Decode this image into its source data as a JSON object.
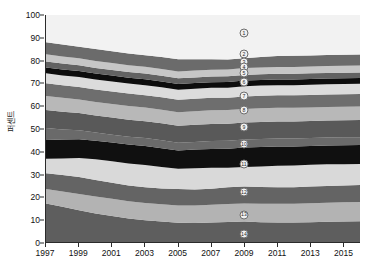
{
  "chart_data": {
    "type": "area",
    "stacked": true,
    "title": "",
    "subtitle": "",
    "xlabel": "",
    "ylabel": "퍼센트",
    "xlim": [
      1997,
      2016
    ],
    "ylim": [
      0,
      100
    ],
    "grid": false,
    "legend_position": "none",
    "x": [
      1997,
      1998,
      1999,
      2000,
      2001,
      2002,
      2003,
      2004,
      2005,
      2006,
      2007,
      2008,
      2009,
      2010,
      2011,
      2012,
      2013,
      2014,
      2015,
      2016
    ],
    "xticks": [
      "1997",
      "1999",
      "2001",
      "2003",
      "2005",
      "2007",
      "2009",
      "2011",
      "2013",
      "2015"
    ],
    "xtick_values": [
      1997,
      1999,
      2001,
      2003,
      2005,
      2007,
      2009,
      2011,
      2013,
      2015
    ],
    "yticks": [
      "0",
      "10",
      "20",
      "30",
      "40",
      "50",
      "60",
      "70",
      "80",
      "90",
      "100"
    ],
    "ytick_values": [
      0,
      10,
      20,
      30,
      40,
      50,
      60,
      70,
      80,
      90,
      100
    ],
    "annotations": [
      {
        "label": "1",
        "x": 2009,
        "y": 92.0
      },
      {
        "label": "2",
        "x": 2009,
        "y": 83.0
      },
      {
        "label": "3",
        "x": 2009,
        "y": 79.5
      },
      {
        "label": "4",
        "x": 2009,
        "y": 77.0
      },
      {
        "label": "5",
        "x": 2009,
        "y": 74.5
      },
      {
        "label": "6",
        "x": 2009,
        "y": 70.5
      },
      {
        "label": "7",
        "x": 2009,
        "y": 64.5
      },
      {
        "label": "8",
        "x": 2009,
        "y": 58.5
      },
      {
        "label": "9",
        "x": 2009,
        "y": 51.0
      },
      {
        "label": "10",
        "x": 2009,
        "y": 43.5
      },
      {
        "label": "11",
        "x": 2009,
        "y": 34.5
      },
      {
        "label": "12",
        "x": 2009,
        "y": 22.5
      },
      {
        "label": "13",
        "x": 2009,
        "y": 12.5
      },
      {
        "label": "14",
        "x": 2009,
        "y": 4.0
      }
    ],
    "series": [
      {
        "name": "14",
        "marker_label": "14",
        "color": "#5e5e5e",
        "values": [
          17.0,
          15.5,
          14.0,
          12.6,
          11.5,
          10.4,
          9.6,
          9.0,
          8.5,
          8.4,
          8.6,
          8.8,
          9.0,
          8.7,
          8.6,
          8.6,
          8.7,
          8.9,
          9.0,
          9.1
        ]
      },
      {
        "name": "13",
        "marker_label": "13",
        "color": "#b3b3b3",
        "values": [
          6.4,
          6.8,
          7.2,
          7.4,
          7.5,
          7.6,
          7.6,
          7.6,
          7.6,
          7.7,
          7.8,
          7.9,
          8.0,
          8.2,
          8.3,
          8.3,
          8.4,
          8.4,
          8.5,
          8.5
        ]
      },
      {
        "name": "12",
        "marker_label": "12",
        "color": "#646464",
        "values": [
          6.9,
          7.2,
          7.4,
          7.3,
          7.1,
          6.9,
          6.9,
          7.0,
          7.3,
          7.0,
          7.1,
          7.4,
          7.5,
          7.3,
          7.2,
          7.2,
          7.3,
          7.4,
          7.4,
          7.5
        ]
      },
      {
        "name": "11",
        "marker_label": "11",
        "color": "#d9d9d9",
        "values": [
          6.4,
          7.3,
          8.4,
          9.1,
          9.5,
          9.7,
          9.8,
          9.4,
          8.9,
          9.4,
          9.2,
          8.6,
          8.5,
          9.1,
          9.5,
          9.6,
          9.6,
          9.5,
          9.4,
          9.3
        ]
      },
      {
        "name": "10",
        "marker_label": "10",
        "color": "#101010",
        "values": [
          8.2,
          8.4,
          8.3,
          8.2,
          8.2,
          8.3,
          8.4,
          8.3,
          8.0,
          8.2,
          8.3,
          8.4,
          8.6,
          8.6,
          8.5,
          8.4,
          8.3,
          8.3,
          8.3,
          8.3
        ]
      },
      {
        "name": "9",
        "marker_label": "9",
        "color": "#6a6a6a",
        "values": [
          5.3,
          4.4,
          3.9,
          3.6,
          3.5,
          3.5,
          3.5,
          3.5,
          3.4,
          3.4,
          3.5,
          3.5,
          3.5,
          3.5,
          3.5,
          3.5,
          3.5,
          3.5,
          3.5,
          3.5
        ]
      },
      {
        "name": "8",
        "marker_label": "8",
        "color": "#595959",
        "values": [
          7.9,
          7.8,
          7.6,
          7.5,
          7.5,
          7.5,
          7.4,
          7.5,
          7.5,
          7.5,
          7.5,
          7.5,
          7.5,
          7.5,
          7.5,
          7.5,
          7.5,
          7.5,
          7.5,
          7.5
        ]
      },
      {
        "name": "7",
        "marker_label": "7",
        "color": "#b8b8b8",
        "values": [
          6.2,
          6.1,
          6.0,
          6.0,
          6.0,
          6.0,
          6.0,
          6.0,
          6.0,
          6.0,
          6.0,
          6.0,
          6.0,
          6.0,
          6.0,
          6.0,
          6.0,
          6.0,
          6.0,
          6.0
        ]
      },
      {
        "name": "6",
        "marker_label": "6",
        "color": "#6e6e6e",
        "values": [
          5.6,
          5.5,
          5.5,
          5.5,
          5.5,
          5.5,
          5.5,
          5.5,
          5.5,
          5.5,
          5.5,
          5.5,
          5.5,
          5.5,
          5.5,
          5.5,
          5.5,
          5.5,
          5.5,
          5.5
        ]
      },
      {
        "name": "5",
        "marker_label": "5",
        "color": "#dcdcdc",
        "values": [
          4.4,
          4.4,
          4.4,
          4.4,
          4.4,
          4.4,
          4.4,
          4.4,
          4.4,
          4.4,
          4.4,
          4.4,
          4.5,
          4.5,
          4.5,
          4.5,
          4.5,
          4.5,
          4.5,
          4.5
        ]
      },
      {
        "name": "4",
        "marker_label": "4",
        "color": "#0d0d0d",
        "values": [
          2.6,
          2.6,
          2.6,
          2.6,
          2.6,
          2.6,
          2.6,
          2.5,
          2.5,
          2.5,
          2.5,
          2.5,
          2.5,
          2.5,
          2.5,
          2.5,
          2.5,
          2.5,
          2.5,
          2.5
        ]
      },
      {
        "name": "3",
        "marker_label": "3",
        "color": "#626262",
        "values": [
          2.6,
          2.6,
          2.6,
          2.5,
          2.5,
          2.5,
          2.5,
          2.5,
          2.5,
          2.5,
          2.5,
          2.5,
          2.5,
          2.5,
          2.5,
          2.5,
          2.5,
          2.5,
          2.5,
          2.5
        ]
      },
      {
        "name": "2",
        "marker_label": "2",
        "color": "#c6c6c6",
        "values": [
          3.2,
          3.1,
          3.0,
          3.0,
          3.0,
          3.0,
          3.0,
          3.0,
          3.0,
          3.0,
          3.0,
          3.0,
          3.0,
          3.0,
          3.0,
          3.0,
          3.0,
          3.0,
          3.0,
          3.0
        ]
      },
      {
        "name": "1",
        "marker_label": "1",
        "color": "#6b6b6b",
        "values": [
          5.3,
          5.3,
          5.1,
          5.3,
          5.2,
          5.1,
          5.1,
          5.3,
          5.4,
          5.0,
          4.6,
          4.4,
          4.4,
          4.6,
          4.8,
          4.9,
          4.9,
          4.9,
          4.9,
          4.9
        ]
      }
    ],
    "top_band": {
      "name": "remainder",
      "color": "#f2f2f2"
    },
    "axis_color": "#2b2b2b",
    "plot_background": "#f2f2f2",
    "marker_fill": "#f0f0f0",
    "marker_stroke": "#6d6d6d"
  }
}
